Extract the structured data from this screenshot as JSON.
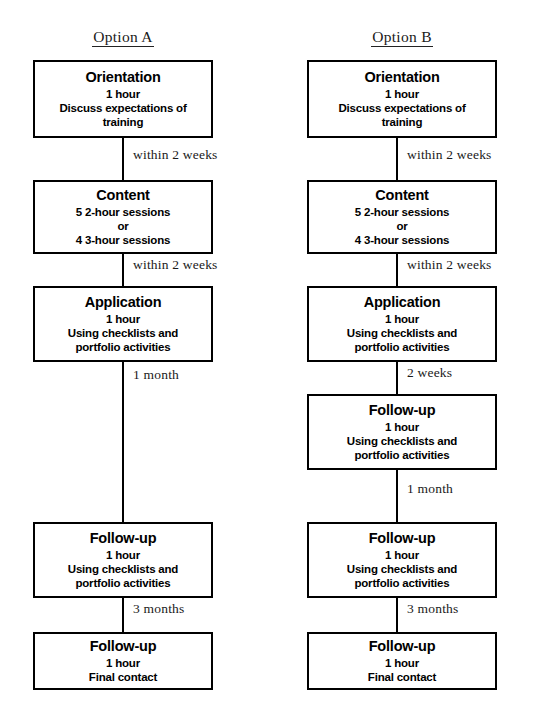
{
  "diagram": {
    "columns": [
      {
        "id": "option-a",
        "heading": "Option A",
        "nodes": [
          {
            "id": "a-orientation",
            "title": "Orientation",
            "lines": [
              "1 hour",
              "Discuss expectations of",
              "training"
            ]
          },
          {
            "id": "a-content",
            "title": "Content",
            "lines": [
              "5  2-hour sessions",
              "or",
              "4  3-hour sessions"
            ]
          },
          {
            "id": "a-application",
            "title": "Application",
            "lines": [
              "1 hour",
              "Using checklists and",
              "portfolio activities"
            ]
          },
          {
            "id": "a-followup-1",
            "title": "Follow-up",
            "lines": [
              "1 hour",
              "Using checklists and",
              "portfolio activities"
            ]
          },
          {
            "id": "a-followup-2",
            "title": "Follow-up",
            "lines": [
              "1 hour",
              "Final contact"
            ]
          }
        ],
        "connectors": [
          {
            "id": "a-conn-1",
            "label": "within 2 weeks"
          },
          {
            "id": "a-conn-2",
            "label": "within 2 weeks"
          },
          {
            "id": "a-conn-3",
            "label": "1 month"
          },
          {
            "id": "a-conn-4",
            "label": "3 months"
          }
        ]
      },
      {
        "id": "option-b",
        "heading": "Option B",
        "nodes": [
          {
            "id": "b-orientation",
            "title": "Orientation",
            "lines": [
              "1 hour",
              "Discuss expectations of",
              "training"
            ]
          },
          {
            "id": "b-content",
            "title": "Content",
            "lines": [
              "5  2-hour sessions",
              "or",
              "4  3-hour sessions"
            ]
          },
          {
            "id": "b-application",
            "title": "Application",
            "lines": [
              "1 hour",
              "Using checklists and",
              "portfolio activities"
            ]
          },
          {
            "id": "b-followup-1",
            "title": "Follow-up",
            "lines": [
              "1 hour",
              "Using checklists and",
              "portfolio activities"
            ]
          },
          {
            "id": "b-followup-2",
            "title": "Follow-up",
            "lines": [
              "1 hour",
              "Using checklists and",
              "portfolio activities"
            ]
          },
          {
            "id": "b-followup-3",
            "title": "Follow-up",
            "lines": [
              "1 hour",
              "Final contact"
            ]
          }
        ],
        "connectors": [
          {
            "id": "b-conn-1",
            "label": "within 2 weeks"
          },
          {
            "id": "b-conn-2",
            "label": "within 2 weeks"
          },
          {
            "id": "b-conn-3",
            "label": "2 weeks"
          },
          {
            "id": "b-conn-4",
            "label": "1 month"
          },
          {
            "id": "b-conn-5",
            "label": "3 months"
          }
        ]
      }
    ]
  },
  "colors": {
    "stroke": "#000000",
    "background": "#ffffff",
    "text": "#000000",
    "label_text": "#1a1a1a"
  }
}
